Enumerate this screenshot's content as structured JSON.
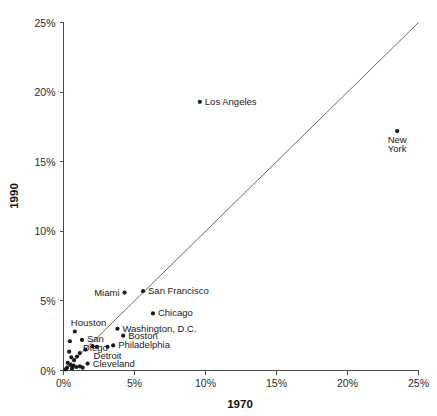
{
  "chart_data": {
    "type": "scatter",
    "title": "",
    "xlabel": "1970",
    "ylabel": "1990",
    "xlim": [
      0,
      25
    ],
    "ylim": [
      0,
      25
    ],
    "grid": false,
    "legend": "none",
    "unit": "%",
    "xticks": [
      "0%",
      "5%",
      "10%",
      "15%",
      "20%",
      "25%"
    ],
    "xtick_values": [
      0,
      5,
      10,
      15,
      20,
      25
    ],
    "yticks": [
      "0%",
      "5%",
      "10%",
      "15%",
      "20%",
      "25%"
    ],
    "ytick_values": [
      0,
      5,
      10,
      15,
      20,
      25
    ],
    "reference_line": {
      "description": "y = x diagonal",
      "from": [
        0,
        0
      ],
      "to": [
        25,
        25
      ]
    },
    "points": [
      {
        "label": "Los Angeles",
        "x": 9.6,
        "y": 19.3,
        "label_pos": "right"
      },
      {
        "label": "New York",
        "x": 23.5,
        "y": 17.2,
        "label_pos": "below"
      },
      {
        "label": "Miami",
        "x": 4.3,
        "y": 5.6,
        "label_pos": "left"
      },
      {
        "label": "San Francisco",
        "x": 5.6,
        "y": 5.7,
        "label_pos": "right"
      },
      {
        "label": "Chicago",
        "x": 6.3,
        "y": 4.1,
        "label_pos": "right"
      },
      {
        "label": "Washington, D.C.",
        "x": 3.8,
        "y": 3.0,
        "label_pos": "right"
      },
      {
        "label": "Boston",
        "x": 4.2,
        "y": 2.5,
        "label_pos": "right"
      },
      {
        "label": "Houston",
        "x": 0.8,
        "y": 2.8,
        "label_pos": "above"
      },
      {
        "label": "San Diego",
        "x": 1.3,
        "y": 2.2,
        "label_pos": "right-stack"
      },
      {
        "label": "Philadelphia",
        "x": 3.5,
        "y": 1.8,
        "label_pos": "right"
      },
      {
        "label": "Detroit",
        "x": 3.1,
        "y": 1.7,
        "label_pos": "below"
      },
      {
        "label": "Cleveland",
        "x": 1.7,
        "y": 0.5,
        "label_pos": "right"
      },
      {
        "label": "",
        "x": 0.45,
        "y": 2.1,
        "label_pos": "none"
      },
      {
        "label": "",
        "x": 0.4,
        "y": 1.35,
        "label_pos": "none"
      },
      {
        "label": "",
        "x": 0.55,
        "y": 0.95,
        "label_pos": "none"
      },
      {
        "label": "",
        "x": 0.75,
        "y": 0.75,
        "label_pos": "none"
      },
      {
        "label": "",
        "x": 0.95,
        "y": 1.0,
        "label_pos": "none"
      },
      {
        "label": "",
        "x": 1.15,
        "y": 1.25,
        "label_pos": "none"
      },
      {
        "label": "",
        "x": 0.3,
        "y": 0.55,
        "label_pos": "none"
      },
      {
        "label": "",
        "x": 0.5,
        "y": 0.4,
        "label_pos": "none"
      },
      {
        "label": "",
        "x": 0.7,
        "y": 0.35,
        "label_pos": "none"
      },
      {
        "label": "",
        "x": 0.25,
        "y": 0.2,
        "label_pos": "none"
      },
      {
        "label": "",
        "x": 0.6,
        "y": 0.15,
        "label_pos": "none"
      },
      {
        "label": "",
        "x": 0.9,
        "y": 0.25,
        "label_pos": "none"
      },
      {
        "label": "",
        "x": 1.15,
        "y": 0.3,
        "label_pos": "none"
      },
      {
        "label": "",
        "x": 1.35,
        "y": 0.2,
        "label_pos": "none"
      },
      {
        "label": "",
        "x": 0.15,
        "y": 0.08,
        "label_pos": "none"
      },
      {
        "label": "",
        "x": 1.55,
        "y": 1.5,
        "label_pos": "none"
      },
      {
        "label": "",
        "x": 2.05,
        "y": 1.75,
        "label_pos": "none"
      },
      {
        "label": "",
        "x": 2.35,
        "y": 1.7,
        "label_pos": "none"
      }
    ]
  },
  "axes": {
    "x_title": "1970",
    "y_title": "1990"
  }
}
